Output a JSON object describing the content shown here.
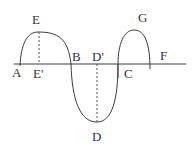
{
  "diagram": {
    "type": "wave-curve-on-axis",
    "line_color": "#3a3a3a",
    "dash_color": "#555555",
    "axis": {
      "x1": 14,
      "x2": 186,
      "y": 64
    },
    "labels": {
      "A": "A",
      "E": "E",
      "E_prime": "E'",
      "B": "B",
      "D_prime": "D'",
      "D": "D",
      "C": "C",
      "G": "G",
      "F": "F"
    },
    "label_positions": {
      "A": [
        12,
        77
      ],
      "E": [
        32,
        24
      ],
      "E_prime": [
        33,
        78
      ],
      "B": [
        72,
        62
      ],
      "D_prime": [
        92,
        62
      ],
      "D": [
        93,
        140
      ],
      "C": [
        126,
        77
      ],
      "G": [
        137,
        22
      ],
      "F": [
        160,
        60
      ]
    }
  }
}
